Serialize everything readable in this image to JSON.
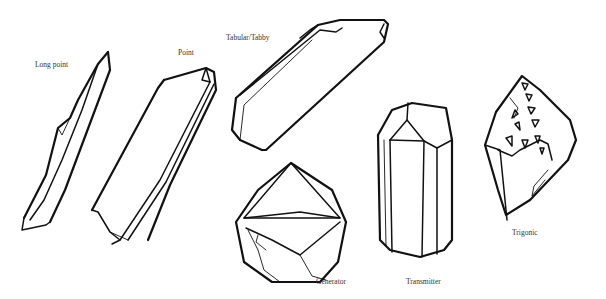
{
  "labels": {
    "long_point": "Long point",
    "point": "Point",
    "tabular": "Tabular/Tabby",
    "generator": "Generator",
    "transmitter": "Transmitter",
    "trigonic": "Trigonic"
  },
  "colors": {
    "line": "#111111",
    "label": "#333333",
    "background": "#ffffff"
  }
}
